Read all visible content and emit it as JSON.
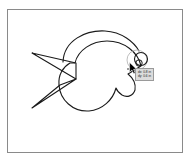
{
  "app": {
    "name": "vector-drawing-canvas",
    "background_color": "#ffffff"
  },
  "canvas": {
    "name": "drawing-canvas",
    "frame_color": "#8a8a8a",
    "fill_color": "#ffffff"
  },
  "drawing": {
    "name": "fish-shape",
    "stroke_color": "#1a1a1a",
    "fill": "none",
    "parts": [
      {
        "name": "tail-triangle",
        "label": "Tail"
      },
      {
        "name": "body-circle",
        "label": "Body"
      },
      {
        "name": "top-fin-arc",
        "label": "Top fin"
      },
      {
        "name": "mouth-notch",
        "label": "Mouth"
      },
      {
        "name": "eye-circle",
        "label": "Eye"
      },
      {
        "name": "selection-circle",
        "label": "Selection"
      }
    ]
  },
  "tooltip": {
    "name": "dimension-tooltip",
    "background_color": "#dcdcdc",
    "border_color": "#9a9a9a",
    "text_color": "#1a1a1a",
    "line1": "dx: 0.8 in",
    "line2": "dy: 0.6 in"
  },
  "cursor": {
    "name": "mouse-cursor",
    "type": "arrow",
    "color": "#000000"
  }
}
